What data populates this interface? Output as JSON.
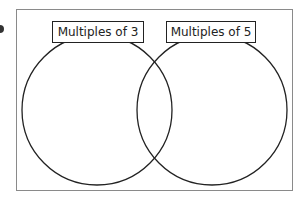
{
  "diagram": {
    "type": "venn",
    "sets": [
      {
        "label": "Multiples of 3",
        "center": [
          97,
          110
        ],
        "radius": 75
      },
      {
        "label": "Multiples of 5",
        "center": [
          212,
          110
        ],
        "radius": 75
      }
    ],
    "colors": {
      "frame": "#8a8a8a",
      "outline": "#222222",
      "background": "#ffffff"
    }
  }
}
